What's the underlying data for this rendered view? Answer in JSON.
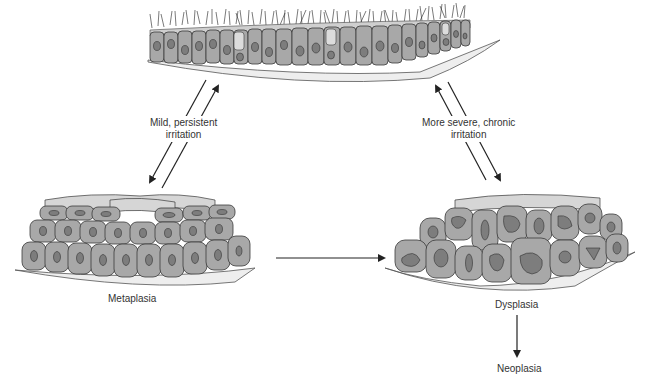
{
  "diagram": {
    "nodes": {
      "normal": {
        "label": ""
      },
      "metaplasia": {
        "label": "Metaplasia"
      },
      "dysplasia": {
        "label": "Dysplasia"
      },
      "neoplasia": {
        "label": "Neoplasia"
      }
    },
    "edges": {
      "mild": {
        "line1": "Mild, persistent",
        "line2": "irritation"
      },
      "severe": {
        "line1": "More severe, chronic",
        "line2": "irritation"
      }
    },
    "colors": {
      "cell_fill": "#a8a8a8",
      "cell_top": "#d9d9d9",
      "nucleus": "#7d7d7d",
      "outline": "#3a3a3a",
      "basement": "#e8e8e8"
    }
  }
}
